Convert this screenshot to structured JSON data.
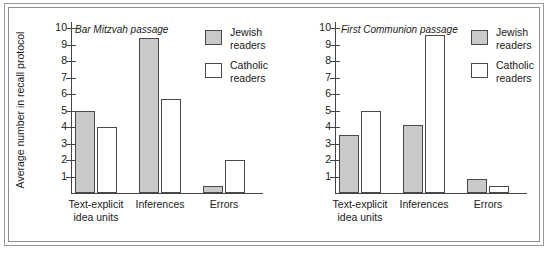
{
  "chart_data": [
    {
      "type": "bar",
      "title": "Bar Mitzvah passage",
      "xlabel": "",
      "ylabel": "Average number in recall protocol",
      "ylim": [
        0,
        10
      ],
      "yticks": [
        10,
        9,
        8,
        7,
        6,
        5,
        4,
        3,
        2,
        1
      ],
      "grid": false,
      "legend_position": "top-right",
      "categories": [
        "Text-explicit idea units",
        "Inferences",
        "Errors"
      ],
      "series": [
        {
          "name": "Jewish readers",
          "values": [
            5.0,
            9.4,
            0.45
          ],
          "color": "#c9c9c9"
        },
        {
          "name": "Catholic readers",
          "values": [
            4.0,
            5.7,
            2.0
          ],
          "color": "#ffffff"
        }
      ]
    },
    {
      "type": "bar",
      "title": "First Communion passage",
      "xlabel": "",
      "ylabel": "",
      "ylim": [
        0,
        10
      ],
      "yticks": [
        10,
        9,
        8,
        7,
        6,
        5,
        4,
        3,
        2,
        1
      ],
      "grid": false,
      "legend_position": "top-right",
      "categories": [
        "Text-explicit idea units",
        "Inferences",
        "Errors"
      ],
      "series": [
        {
          "name": "Jewish readers",
          "values": [
            3.5,
            4.1,
            0.85
          ],
          "color": "#c9c9c9"
        },
        {
          "name": "Catholic readers",
          "values": [
            5.0,
            9.55,
            0.4
          ],
          "color": "#ffffff"
        }
      ]
    }
  ],
  "axis": {
    "y_title": "Average number in recall protocol",
    "ticks": [
      "10",
      "9",
      "8",
      "7",
      "6",
      "5",
      "4",
      "3",
      "2",
      "1"
    ]
  },
  "panels": [
    {
      "title": "Bar Mitzvah passage",
      "groups": [
        {
          "label_line1": "Text-explicit",
          "label_line2": "idea units"
        },
        {
          "label_line1": "Inferences",
          "label_line2": ""
        },
        {
          "label_line1": "Errors",
          "label_line2": ""
        }
      ],
      "legend": [
        {
          "label_line1": "Jewish",
          "label_line2": "readers"
        },
        {
          "label_line1": "Catholic",
          "label_line2": "readers"
        }
      ]
    },
    {
      "title": "First Communion passage",
      "groups": [
        {
          "label_line1": "Text-explicit",
          "label_line2": "idea units"
        },
        {
          "label_line1": "Inferences",
          "label_line2": ""
        },
        {
          "label_line1": "Errors",
          "label_line2": ""
        }
      ],
      "legend": [
        {
          "label_line1": "Jewish",
          "label_line2": "readers"
        },
        {
          "label_line1": "Catholic",
          "label_line2": "readers"
        }
      ]
    }
  ],
  "colors": {
    "jewish_fill": "#c9c9c9",
    "catholic_fill": "#ffffff",
    "bar_stroke": "#4a4a4a",
    "axis": "#454545",
    "text": "#1a1a1a",
    "frame": "#9a9a9a"
  }
}
